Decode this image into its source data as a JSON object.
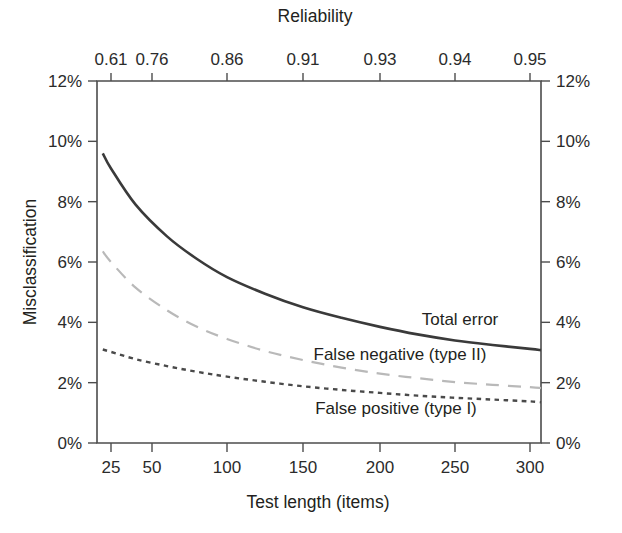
{
  "chart_data": {
    "type": "line",
    "title": "",
    "xlabel": "Test length (items)",
    "ylabel": "Misclassification",
    "top_axis_label": "Reliability",
    "xlim": [
      20,
      310
    ],
    "ylim": [
      0,
      12
    ],
    "grid": false,
    "legend_position": "inline-right",
    "x_ticks": [
      25,
      50,
      100,
      150,
      200,
      250,
      300
    ],
    "x_tick_labels": [
      "25",
      "50",
      "100",
      "150",
      "200",
      "250",
      "300"
    ],
    "top_ticks": [
      25,
      50,
      100,
      150,
      200,
      250,
      300
    ],
    "top_tick_labels": [
      "0.61",
      "0.76",
      "0.86",
      "0.91",
      "0.93",
      "0.94",
      "0.95"
    ],
    "y_ticks": [
      0,
      2,
      4,
      6,
      8,
      10,
      12
    ],
    "y_tick_labels": [
      "0%",
      "2%",
      "4%",
      "6%",
      "8%",
      "10%",
      "12%"
    ],
    "y_right_tick_labels": [
      "0%",
      "2%",
      "4%",
      "6%",
      "8%",
      "10%",
      "12%"
    ],
    "x": [
      20,
      25,
      40,
      60,
      80,
      100,
      125,
      150,
      175,
      200,
      225,
      250,
      275,
      300,
      310
    ],
    "series": [
      {
        "name": "Total error",
        "label": "Total error",
        "color": "#3a3a3a",
        "dash": "none",
        "width": 2.6,
        "values": [
          9.6,
          9.1,
          7.9,
          6.85,
          6.1,
          5.5,
          4.95,
          4.5,
          4.15,
          3.85,
          3.6,
          3.4,
          3.25,
          3.12,
          3.08
        ]
      },
      {
        "name": "False negative (type II)",
        "label": "False negative (type II)",
        "color": "#b9b9b9",
        "dash": "13,9",
        "width": 2.2,
        "values": [
          6.35,
          6.0,
          5.15,
          4.4,
          3.85,
          3.45,
          3.05,
          2.75,
          2.5,
          2.3,
          2.15,
          2.02,
          1.93,
          1.85,
          1.82
        ]
      },
      {
        "name": "False positive (type I)",
        "label": "False positive (type I)",
        "color": "#4a4a4a",
        "dash": "4.5,4.5",
        "width": 2.4,
        "values": [
          3.1,
          3.02,
          2.78,
          2.55,
          2.36,
          2.2,
          2.03,
          1.88,
          1.76,
          1.66,
          1.57,
          1.5,
          1.44,
          1.38,
          1.35
        ]
      }
    ],
    "annotations": [
      {
        "text": "Total error",
        "x_px": 460,
        "y_px": 325
      },
      {
        "text": "False negative (type II)",
        "x_px": 400,
        "y_px": 360
      },
      {
        "text": "False positive (type I)",
        "x_px": 396,
        "y_px": 414
      }
    ]
  },
  "axes": {
    "top_title": "Reliability",
    "bottom_title": "Test length (items)",
    "left_title": "Misclassification"
  }
}
